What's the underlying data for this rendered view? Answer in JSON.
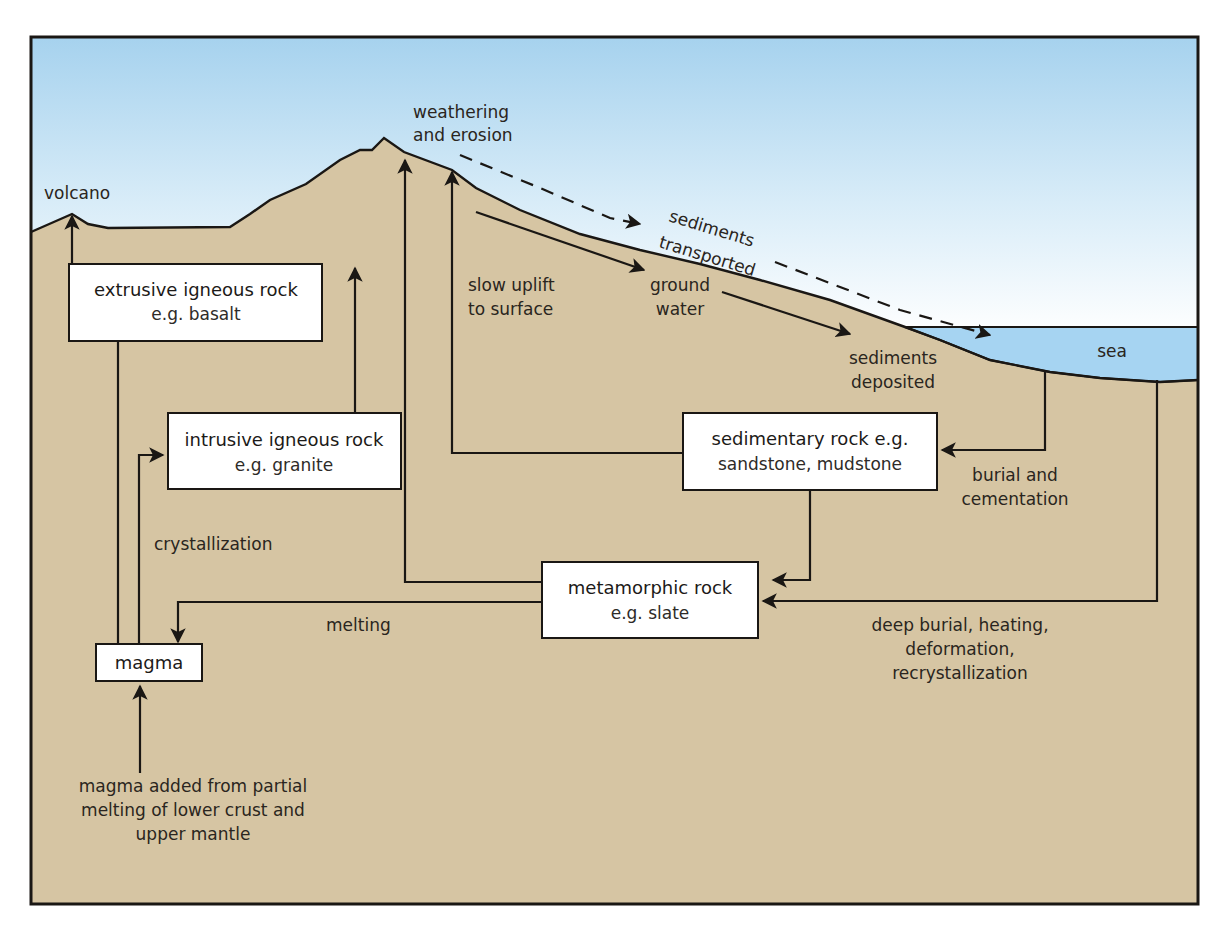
{
  "colors": {
    "sky_top": "#a9d4ef",
    "sky_bottom": "#ffffff",
    "ground": "#d6c5a3",
    "sea": "#a6d4f2",
    "line": "#1a1714",
    "box_fill": "#ffffff"
  },
  "labels": {
    "volcano": "volcano",
    "weathering_1": "weathering",
    "weathering_2": "and erosion",
    "sediments_transported_1": "sediments",
    "sediments_transported_2": "transported",
    "slow_uplift_1": "slow uplift",
    "slow_uplift_2": "to surface",
    "ground_water_1": "ground",
    "ground_water_2": "water",
    "sediments_deposited_1": "sediments",
    "sediments_deposited_2": "deposited",
    "sea": "sea",
    "burial_1": "burial and",
    "burial_2": "cementation",
    "crystallization": "crystallization",
    "melting": "melting",
    "deep_burial_1": "deep burial, heating,",
    "deep_burial_2": "deformation,",
    "deep_burial_3": "recrystallization",
    "magma_added_1": "magma added from partial",
    "magma_added_2": "melting of lower crust and",
    "magma_added_3": "upper mantle"
  },
  "boxes": {
    "extrusive": {
      "title": "extrusive igneous rock",
      "example": "e.g. basalt"
    },
    "intrusive": {
      "title": "intrusive igneous rock",
      "example": "e.g. granite"
    },
    "sedimentary": {
      "title": "sedimentary rock e.g.",
      "example": "sandstone, mudstone"
    },
    "metamorphic": {
      "title": "metamorphic rock",
      "example": "e.g. slate"
    },
    "magma": {
      "title": "magma"
    }
  }
}
